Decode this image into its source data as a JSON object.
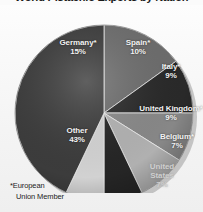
{
  "title": "World Pistachio Exports by Nation",
  "footnote": {
    "line1": "*European",
    "line2": "Union Member"
  },
  "colors": {
    "background": "#fbfbfb",
    "plate": "#f4f4f4",
    "germany": "#6e6e6e",
    "spain": "#2a2a2a",
    "italy": "#8a8a8a",
    "united_kingdom": "#b4b4b4",
    "belgium": "#262626",
    "united_states": "#d6d6d6",
    "other": "#3d3d3d",
    "label_light": "#f2f2f2",
    "label_dark": "#2b2b2b"
  },
  "chart_data": {
    "type": "pie",
    "title": "World Pistachio Exports by Nation",
    "categories": [
      "Germany*",
      "Spain*",
      "Italy*",
      "United Kingdom*",
      "Belgium*",
      "United States",
      "Other"
    ],
    "values": [
      15,
      10,
      9,
      9,
      7,
      7,
      43
    ],
    "value_labels": [
      "15%",
      "10%",
      "9%",
      "9%",
      "7%",
      "7%",
      "43%"
    ],
    "unit": "percent",
    "legend": "none (labels drawn on slices)",
    "grid": false,
    "slices": [
      {
        "name": "Germany*",
        "pct": "15%",
        "value": 15,
        "color": "#6e6e6e",
        "label_style": "light"
      },
      {
        "name": "Spain*",
        "pct": "10%",
        "value": 10,
        "color": "#2a2a2a",
        "label_style": "light"
      },
      {
        "name": "Italy*",
        "pct": "9%",
        "value": 9,
        "color": "#8a8a8a",
        "label_style": "light"
      },
      {
        "name": "United Kingdom*",
        "pct": "9%",
        "value": 9,
        "color": "#b4b4b4",
        "label_style": "light"
      },
      {
        "name": "Belgium*",
        "pct": "7%",
        "value": 7,
        "color": "#262626",
        "label_style": "light"
      },
      {
        "name": "United States",
        "pct": "7%",
        "value": 7,
        "color": "#d6d6d6",
        "label_style": "faded"
      },
      {
        "name": "Other",
        "pct": "43%",
        "value": 43,
        "color": "#3d3d3d",
        "label_style": "light"
      }
    ]
  }
}
